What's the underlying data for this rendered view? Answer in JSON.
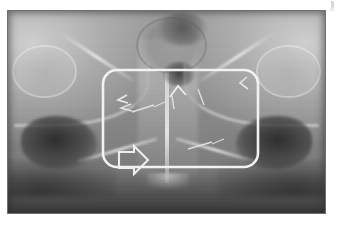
{
  "page": {
    "background_color": "#ffffff",
    "width": 340,
    "height": 225
  },
  "radiograph": {
    "name": "pelvis-ap-radiograph",
    "modality": "X-ray",
    "view": "anteroposterior pelvis",
    "frame": {
      "x": 7,
      "y": 10,
      "width": 319,
      "height": 204
    },
    "frame_border_color": "#6f6f6f",
    "tone_range": {
      "darkest": "#262626",
      "midtone": "#8c8c8c",
      "brightest": "#f2f2f2"
    },
    "anatomy_labels": [
      "right iliac wing",
      "left iliac wing",
      "sacrum",
      "sacroiliac joint right",
      "sacroiliac joint left",
      "right obturator foramen",
      "left obturator foramen",
      "pubic symphysis",
      "bowel gas shadow"
    ]
  },
  "annotations": {
    "roi_box": {
      "name": "region-of-interest-box",
      "shape": "rounded-rectangle",
      "color": "#f2f2f2",
      "stroke_width": 2.5,
      "corner_radius": 14,
      "x": 101,
      "y": 68,
      "width": 155,
      "height": 97
    },
    "arrow": {
      "name": "block-arrow-marker",
      "direction": "right",
      "style": "outlined",
      "color": "#efefef",
      "x": 117,
      "y": 148,
      "width": 38,
      "height": 24
    },
    "chevrons": [
      {
        "name": "chevron-left-upper",
        "direction": "left",
        "x": 117,
        "y": 97
      },
      {
        "name": "chevron-left-lower",
        "direction": "left",
        "x": 121,
        "y": 106
      },
      {
        "name": "chevron-up-left-center",
        "direction": "up-left",
        "x": 176,
        "y": 84
      },
      {
        "name": "chevron-right-upper",
        "direction": "down-left",
        "x": 238,
        "y": 79
      }
    ],
    "tick_marks": [
      {
        "name": "tick-mark-left-oblique",
        "x": 131,
        "y": 108,
        "length": 22,
        "angle": -18
      },
      {
        "name": "tick-mark-left-short",
        "x": 152,
        "y": 104,
        "length": 14,
        "angle": -24
      },
      {
        "name": "tick-mark-center-vertical",
        "x": 171,
        "y": 95,
        "length": 13,
        "angle": 78
      },
      {
        "name": "tick-mark-center-right",
        "x": 196,
        "y": 90,
        "length": 16,
        "angle": 70
      },
      {
        "name": "tick-mark-lower-right",
        "x": 194,
        "y": 142,
        "length": 24,
        "angle": -16
      },
      {
        "name": "tick-mark-lower-right-short",
        "x": 214,
        "y": 147,
        "length": 12,
        "angle": -20
      }
    ]
  },
  "artifacts": {
    "corner_speck": {
      "name": "corner-speck",
      "x": 331,
      "y": 1,
      "color": "#d8d8d8"
    }
  },
  "text_content": {
    "visible_text": "",
    "note": "No visible text, labels, captions or UI chrome appear in this screenshot."
  }
}
